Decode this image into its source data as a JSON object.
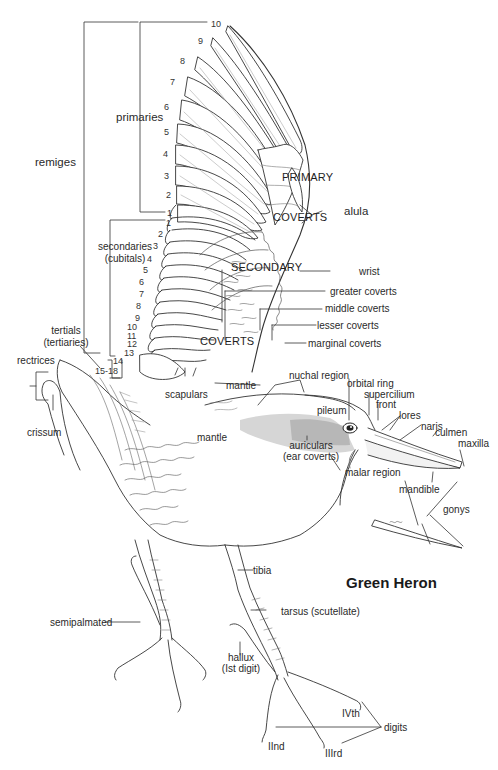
{
  "figure": {
    "title": "Green Heron",
    "wing_groups": {
      "remiges": "remiges",
      "primaries": "primaries",
      "secondaries": "secondaries",
      "secondaries_alt": "(cubitals)",
      "tertials": "tertials",
      "tertials_alt": "(tertiaries)"
    },
    "primary_numbers": [
      "10",
      "9",
      "8",
      "7",
      "6",
      "5",
      "4",
      "3",
      "2",
      "1"
    ],
    "secondary_numbers": [
      "1",
      "2",
      "3",
      "4",
      "5",
      "6",
      "7",
      "8",
      "9",
      "10",
      "11",
      "12",
      "13",
      "14"
    ],
    "tertial_range": "15-18",
    "wing_regions": {
      "primary_coverts_1": "PRIMARY",
      "primary_coverts_2": "COVERTS",
      "secondary_coverts_1": "SECONDARY",
      "secondary_coverts_2": "COVERTS"
    },
    "labels": {
      "alula": "alula",
      "wrist": "wrist",
      "greater_coverts": "greater coverts",
      "middle_coverts": "middle coverts",
      "lesser_coverts": "lesser coverts",
      "marginal_coverts": "marginal coverts",
      "rectrices": "rectrices",
      "crissum": "crissum",
      "scapulars": "scapulars",
      "mantle_upper": "mantle",
      "mantle_lower": "mantle",
      "nuchal_region": "nuchal region",
      "orbital_ring": "orbital ring",
      "supercilium": "supercilium",
      "front": "front",
      "pileum": "pileum",
      "lores": "lores",
      "naris": "naris",
      "culmen": "culmen",
      "maxilla": "maxilla",
      "auriculars": "auriculars",
      "auriculars_alt": "(ear coverts)",
      "malar_region": "malar region",
      "mandible": "mandible",
      "gonys": "gonys",
      "tibia": "tibia",
      "tarsus": "tarsus (scutellate)",
      "semipalmated": "semipalmated",
      "hallux": "hallux",
      "hallux_alt": "(Ist digit)",
      "digit_iv": "IVth",
      "digits": "digits",
      "digit_ii": "IInd",
      "digit_iii": "IIIrd"
    }
  }
}
